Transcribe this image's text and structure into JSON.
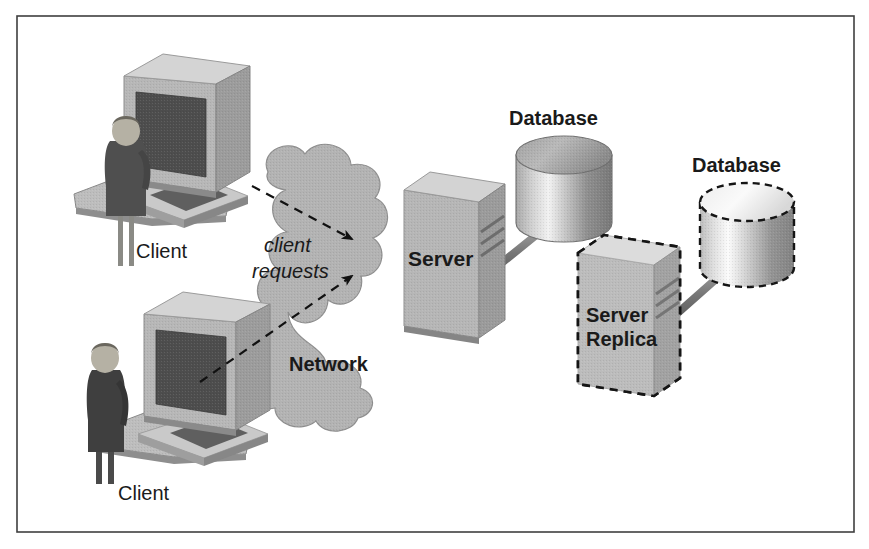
{
  "diagram": {
    "frame": {
      "border_color": "#444444",
      "background_color": "#ffffff"
    },
    "palette": {
      "cloud_fill": "#b3b3b3",
      "cloud_stroke": "#8c8c8c",
      "box_front": "#b5b5b5",
      "box_top": "#d2d2d2",
      "box_side": "#9a9a9a",
      "screen_dark": "#4a4a4a",
      "person_dark": "#4d4d4d",
      "connector_gray": "#7a7a7a",
      "arrow_black": "#111111",
      "dash_black": "#111111",
      "text_color": "#1a1a1a"
    },
    "nodes": {
      "client_top": {
        "label": "Client",
        "kind": "workstation",
        "style": "solid"
      },
      "client_bottom": {
        "label": "Client",
        "kind": "workstation",
        "style": "solid"
      },
      "network_cloud": {
        "label": "Network",
        "inner_label": "client requests",
        "kind": "cloud",
        "style": "solid"
      },
      "server": {
        "label": "Server",
        "kind": "server-box",
        "style": "solid"
      },
      "database_primary": {
        "label": "Database",
        "kind": "cylinder",
        "style": "solid"
      },
      "server_replica": {
        "label_line1": "Server",
        "label_line2": "Replica",
        "kind": "server-box",
        "style": "dashed"
      },
      "database_replica": {
        "label": "Database",
        "kind": "cylinder",
        "style": "dashed"
      }
    },
    "connections": [
      {
        "name": "client-top-to-server",
        "from": "client_top",
        "to": "server",
        "style": "dashed",
        "arrowhead": true
      },
      {
        "name": "client-bottom-to-server",
        "from": "client_bottom",
        "to": "server",
        "style": "dashed",
        "arrowhead": true
      },
      {
        "name": "server-to-database",
        "from": "server",
        "to": "database_primary",
        "style": "solid-rod",
        "arrowhead": false
      },
      {
        "name": "replica-to-database-replica",
        "from": "server_replica",
        "to": "database_replica",
        "style": "solid-rod",
        "arrowhead": false
      }
    ]
  }
}
